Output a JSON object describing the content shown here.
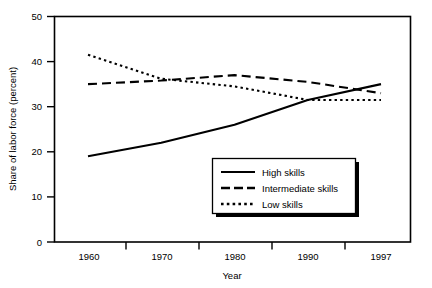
{
  "chart_data": {
    "type": "line",
    "title": "",
    "xlabel": "Year",
    "ylabel": "Share of labor force (percent)",
    "x": [
      1960,
      1970,
      1980,
      1990,
      1997
    ],
    "xticklabels": [
      "1960",
      "1970",
      "1980",
      "1990",
      "1997"
    ],
    "yticklabels": [
      "0",
      "10",
      "20",
      "30",
      "40",
      "50"
    ],
    "yticks": [
      0,
      10,
      20,
      30,
      40,
      50
    ],
    "ylim": [
      0,
      50
    ],
    "xlim": [
      1960,
      1997
    ],
    "grid": false,
    "legend_position": "lower right",
    "series": [
      {
        "name": "High skills",
        "style": "solid",
        "values": [
          19.0,
          22.0,
          26.0,
          31.5,
          35.0
        ]
      },
      {
        "name": "Intermediate skills",
        "style": "dashed",
        "values": [
          35.0,
          35.8,
          37.0,
          35.5,
          33.0
        ]
      },
      {
        "name": "Low skills",
        "style": "dotted",
        "values": [
          41.5,
          36.2,
          34.5,
          31.5,
          31.5
        ]
      }
    ]
  },
  "legend": {
    "entries": [
      {
        "label": "High skills",
        "style": "solid"
      },
      {
        "label": "Intermediate skills",
        "style": "dashed"
      },
      {
        "label": "Low skills",
        "style": "dotted"
      }
    ]
  },
  "colors": {
    "line": "#000000",
    "frame": "#000000",
    "background": "#ffffff",
    "legend_shadow": "#000000"
  }
}
